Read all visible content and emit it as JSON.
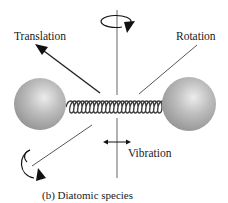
{
  "figure": {
    "labels": {
      "translation": "Translation",
      "rotation": "Rotation",
      "vibration": "Vibration",
      "caption": "(b) Diatomic species"
    },
    "colors": {
      "atom": "#a8a8a8",
      "atom_highlight": "#e6e6e6",
      "spring": "#3a3a3a",
      "line": "#1e1e1e",
      "text": "#1a1a1a"
    },
    "icons": {
      "translation_arrow": "arrow-up-left",
      "rotation_top": "circular-arrow",
      "rotation_bottom_left": "circular-arrow",
      "vibration_arrow": "double-arrow-horizontal"
    }
  }
}
